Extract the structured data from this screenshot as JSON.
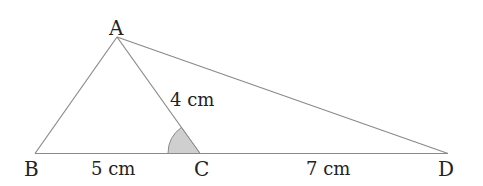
{
  "diagram": {
    "points": {
      "A": {
        "label": "A"
      },
      "B": {
        "label": "B"
      },
      "C": {
        "label": "C"
      },
      "D": {
        "label": "D"
      }
    },
    "lengths": {
      "BC": "5 cm",
      "AC": "4 cm",
      "CD": "7 cm"
    },
    "colors": {
      "line": "#8a8a8a",
      "angle_fill": "#cfcfcf",
      "text": "#222222"
    }
  }
}
